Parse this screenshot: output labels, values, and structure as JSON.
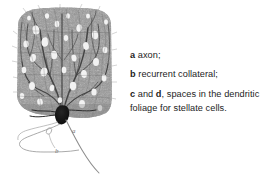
{
  "figure": {
    "caption_lines": [
      {
        "key": "a",
        "text": " axon;"
      },
      {
        "key": "b",
        "text": " recurrent collateral;"
      }
    ],
    "entry_c": {
      "key1": "c",
      "mid": " and ",
      "key2": "d",
      "text": ", spaces in the dendritic foliage for stellate cells."
    },
    "diagram_labels": {
      "axon": "a",
      "collateral": "b"
    },
    "colors": {
      "background": "#ffffff",
      "ink": "#1d1d1d",
      "arbor_grey": "#8a8a8a",
      "arbor_dark": "#4a4a4a",
      "soma_black": "#121212",
      "line_grey": "#9a9a9a"
    },
    "alt": "Purkinje cell dendritic arbor with axon and recurrent collateral"
  }
}
